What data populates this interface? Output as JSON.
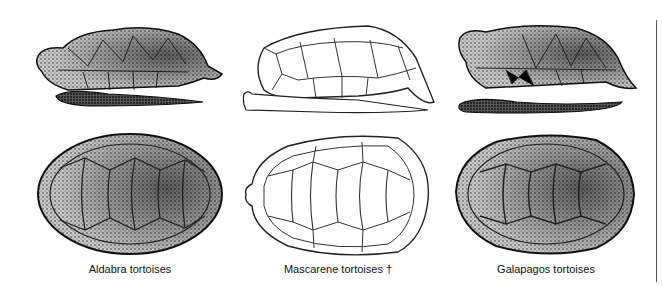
{
  "figure": {
    "panels": [
      {
        "id": "aldabra",
        "label": "Aldabra tortoises",
        "style": "stippled",
        "views": [
          "lateral",
          "dorsal"
        ]
      },
      {
        "id": "mascarene",
        "label": "Mascarene tortoises †",
        "style": "outline",
        "views": [
          "lateral",
          "dorsal"
        ]
      },
      {
        "id": "galapagos",
        "label": "Galapagos tortoises",
        "style": "stippled",
        "views": [
          "lateral",
          "dorsal"
        ]
      }
    ],
    "colors": {
      "ink": "#111111",
      "stipple_dark": "#2a2a2a",
      "stipple_mid": "#6a6a6a",
      "stipple_light": "#b8b8b8",
      "background": "#ffffff",
      "divider": "#555555"
    }
  }
}
